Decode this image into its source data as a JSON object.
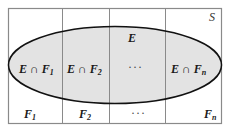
{
  "diagram": {
    "colors": {
      "background": "#ffffff",
      "box_border": "#8a8a8a",
      "divider": "#8a8a8a",
      "ellipse_fill": "#e3e3e3",
      "ellipse_stroke": "#111111",
      "text": "#1a1a1a"
    },
    "sample_space_label": "S",
    "event_label": "E",
    "intersection_labels": [
      {
        "prefix": "E ∩ F",
        "sub": "1"
      },
      {
        "prefix": "E ∩ F",
        "sub": "2"
      },
      {
        "prefix": "",
        "sub": "",
        "ellipsis": "···"
      },
      {
        "prefix": "E ∩ F",
        "sub": "n"
      }
    ],
    "partition_labels": [
      {
        "prefix": "F",
        "sub": "1"
      },
      {
        "prefix": "F",
        "sub": "2"
      },
      {
        "prefix": "",
        "sub": "",
        "ellipsis": "···"
      },
      {
        "prefix": "F",
        "sub": "n"
      }
    ]
  }
}
